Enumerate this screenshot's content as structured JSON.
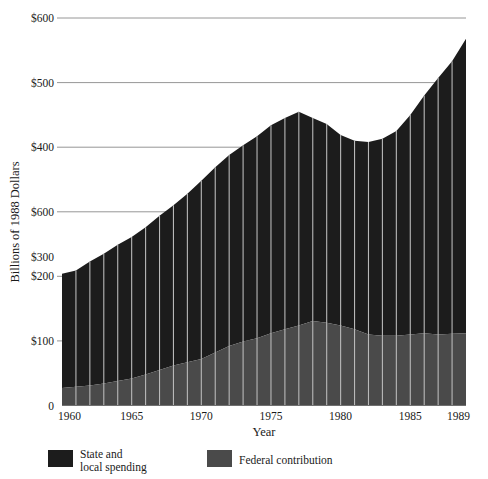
{
  "chart_data": {
    "type": "area",
    "title": "",
    "xlabel": "Year",
    "ylabel": "Billions of 1988 Dollars",
    "stacked": true,
    "grid": true,
    "grid_axis": "y",
    "legend_position": "bottom",
    "xlim": [
      1960,
      1989
    ],
    "ylim": [
      0,
      600
    ],
    "x": [
      1960,
      1961,
      1962,
      1963,
      1964,
      1965,
      1966,
      1967,
      1968,
      1969,
      1970,
      1971,
      1972,
      1973,
      1974,
      1975,
      1976,
      1977,
      1978,
      1979,
      1980,
      1981,
      1982,
      1983,
      1984,
      1985,
      1986,
      1987,
      1988,
      1989
    ],
    "xticks": [
      1960,
      1965,
      1970,
      1975,
      1980,
      1985,
      1989
    ],
    "xticklabels": [
      "1960",
      "1965",
      "1970",
      "1975",
      "1980",
      "1985",
      "1989"
    ],
    "yticks": [
      0,
      100,
      200,
      300,
      400,
      500,
      600
    ],
    "yticklabels": [
      "0",
      "$100",
      "$200",
      "$300",
      "$600",
      "$400",
      "$500",
      "$600"
    ],
    "ytick_display": [
      {
        "value": 600,
        "label": "$600"
      },
      {
        "value": 500,
        "label": "$500"
      },
      {
        "value": 400,
        "label": "$400"
      },
      {
        "value": 300,
        "label": "$600"
      },
      {
        "value": 250,
        "label": "$300"
      },
      {
        "value": 200,
        "label": "$200"
      },
      {
        "value": 100,
        "label": "$100"
      },
      {
        "value": 0,
        "label": "0"
      }
    ],
    "series": [
      {
        "name": "Federal contribution",
        "color": "#4a4a4a",
        "values": [
          27,
          29,
          31,
          34,
          38,
          42,
          48,
          55,
          62,
          67,
          72,
          82,
          92,
          99,
          104,
          112,
          118,
          124,
          131,
          128,
          124,
          118,
          110,
          108,
          108,
          110,
          112,
          110,
          111,
          112
        ]
      },
      {
        "name": "State and local spending",
        "color": "#1c1c1c",
        "values": [
          177,
          180,
          192,
          201,
          211,
          219,
          228,
          239,
          248,
          261,
          276,
          287,
          296,
          304,
          313,
          322,
          327,
          331,
          314,
          308,
          295,
          292,
          298,
          305,
          317,
          340,
          368,
          397,
          422,
          456
        ]
      }
    ],
    "totals": [
      204,
      209,
      223,
      235,
      249,
      261,
      276,
      294,
      310,
      328,
      348,
      369,
      388,
      403,
      417,
      434,
      445,
      455,
      445,
      436,
      419,
      410,
      408,
      413,
      425,
      450,
      480,
      507,
      533,
      568
    ],
    "annotations": []
  },
  "legend": {
    "items": [
      {
        "label_line1": "State and",
        "label_line2": "local spending",
        "color": "#1c1c1c"
      },
      {
        "label_line1": "Federal contribution",
        "label_line2": "",
        "color": "#4a4a4a"
      }
    ]
  },
  "colors": {
    "state_local": "#1c1c1c",
    "federal": "#4a4a4a",
    "gridline": "#8a8a8a",
    "separator": "#b9b9b9",
    "text": "#1a1a1a",
    "background": "#ffffff"
  }
}
